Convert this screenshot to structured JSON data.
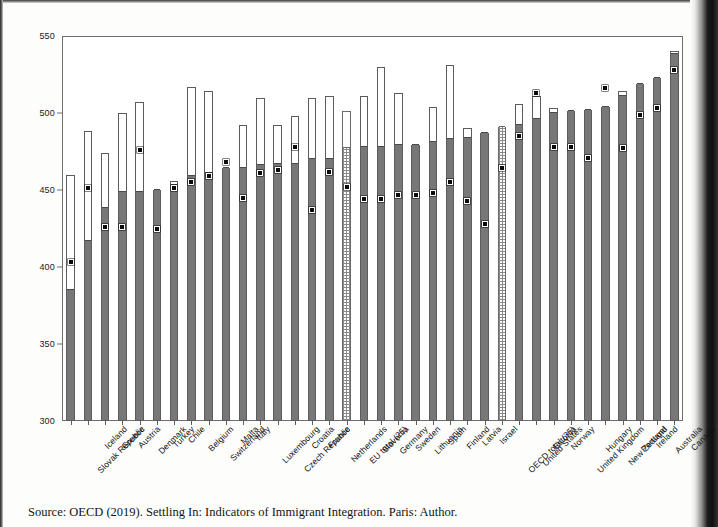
{
  "figure": {
    "source_note": "Source: OECD (2019). Settling In: Indicators of Immigrant Integration. Paris: Author."
  },
  "chart_data": {
    "type": "bar",
    "title": "",
    "xlabel": "",
    "ylabel": "",
    "ylim": [
      300,
      550
    ],
    "yticks": [
      300,
      350,
      400,
      450,
      500,
      550
    ],
    "grid": false,
    "legend_position": "none",
    "categories": [
      "Slovak Republic",
      "Iceland",
      "Greece",
      "Austria",
      "Denmark",
      "Turkey",
      "Chile",
      "Belgium",
      "Switzerland",
      "Malta",
      "Italy",
      "Luxembourg",
      "Czech Republic",
      "Croatia",
      "France",
      "Netherlands",
      "EU total (25)",
      "Slovenia",
      "Germany",
      "Sweden",
      "Lithuania",
      "Spain",
      "Finland",
      "Latvia",
      "Israel",
      "OECD total (35)",
      "United States",
      "Estonia",
      "Norway",
      "United Kingdom",
      "Hungary",
      "New Zealand",
      "Portugal",
      "Ireland",
      "Australia",
      "Canada"
    ],
    "series": [
      {
        "name": "Shaded column (grey)",
        "style": "filled-grey",
        "values": [
          385,
          417,
          438,
          449,
          449,
          450,
          453,
          459,
          461,
          464,
          464,
          466,
          467,
          467,
          470,
          470,
          477,
          478,
          478,
          479,
          479,
          481,
          483,
          484,
          487,
          491,
          492,
          496,
          500,
          501,
          502,
          504,
          511,
          519,
          523,
          538
        ]
      },
      {
        "name": "Open column top (white extension)",
        "style": "open-white",
        "values": [
          460,
          488,
          474,
          500,
          507,
          450,
          456,
          517,
          514,
          464,
          492,
          510,
          492,
          498,
          510,
          511,
          501,
          511,
          530,
          513,
          479,
          504,
          531,
          490,
          487,
          491,
          506,
          511,
          503,
          501,
          502,
          504,
          514,
          519,
          523,
          540
        ]
      },
      {
        "name": "Black dot marker",
        "style": "dot",
        "values": [
          403,
          451,
          426,
          426,
          476,
          425,
          451,
          455,
          459,
          468,
          445,
          461,
          463,
          478,
          437,
          462,
          452,
          444,
          444,
          447,
          447,
          448,
          455,
          443,
          428,
          464,
          485,
          513,
          478,
          478,
          471,
          516,
          477,
          499,
          503,
          528
        ]
      }
    ]
  }
}
